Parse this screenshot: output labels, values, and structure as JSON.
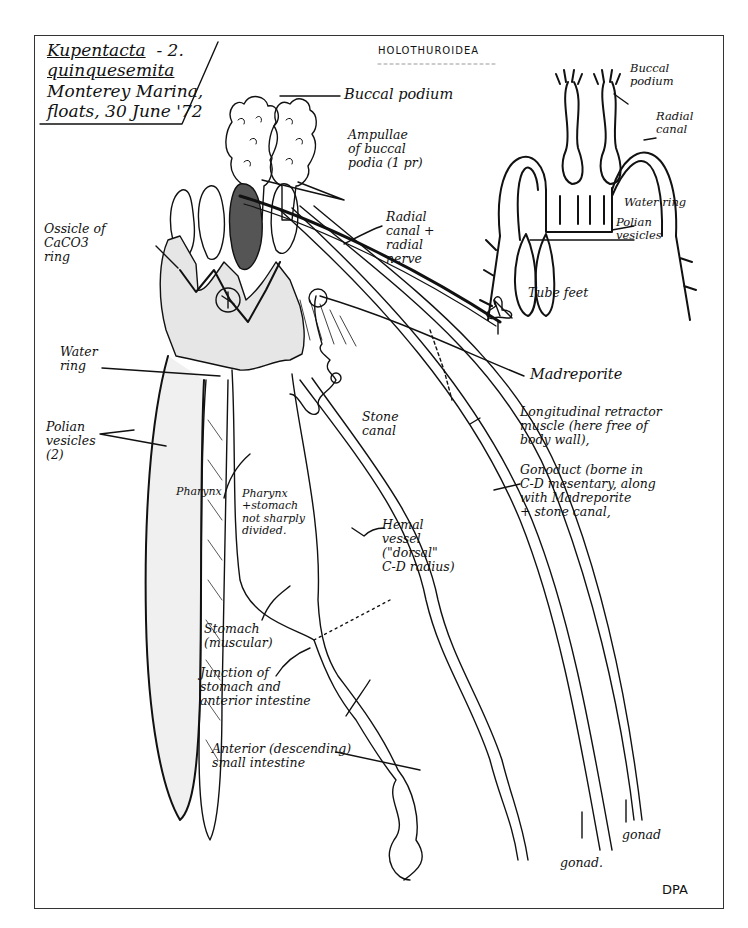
{
  "page": {
    "header": "HOLOTHUROIDEA",
    "signature": "DPA"
  },
  "title_block": {
    "genus": "Kupentacta",
    "plate_number": "- 2.",
    "species": "quinquesemita",
    "locality": "Monterey Marina,",
    "collection": "floats, 30 June '72"
  },
  "inset": {
    "labels": {
      "buccal_podium": "Buccal\npodium",
      "radial_canal": "Radial\ncanal",
      "water_ring": "Water ring",
      "polian_vesicles": "Polian\nvesicles"
    }
  },
  "main_diagram": {
    "labels": {
      "buccal_podium": "Buccal podium",
      "ampullae": "Ampullae\nof buccal\npodia (1 pr)",
      "ossicle": "Ossicle of\nCaCO3\nring",
      "radial_canal_nerve": "Radial\ncanal +\nradial\nnerve",
      "tube_feet": "Tube feet",
      "water_ring": "Water\nring",
      "madreporite": "Madreporite",
      "polian_vesicles": "Polian\nvesicles\n(2)",
      "stone_canal": "Stone\ncanal",
      "longitudinal_retractor": "Longitudinal retractor\nmuscle (here free of\nbody wall),",
      "gonoduct": "Gonoduct (borne in\nC-D mesentary, along\nwith Madreporite\n+ stone canal,",
      "pharynx": "Pharynx",
      "pharynx_stomach": "Pharynx\n+stomach\nnot sharply\ndivided.",
      "hemal_vessel": "Hemal\nvessel\n(\"dorsal\"\nC-D radius)",
      "stomach": "Stomach\n(muscular)",
      "junction": "Junction of\nstomach and\nanterior intestine",
      "anterior_intestine": "Anterior (descending)\nsmall intestine",
      "gonad_left": "gonad.",
      "gonad_right": "gonad"
    }
  },
  "colors": {
    "ink": "#111111",
    "paper": "#ffffff",
    "frame": "#333333"
  }
}
